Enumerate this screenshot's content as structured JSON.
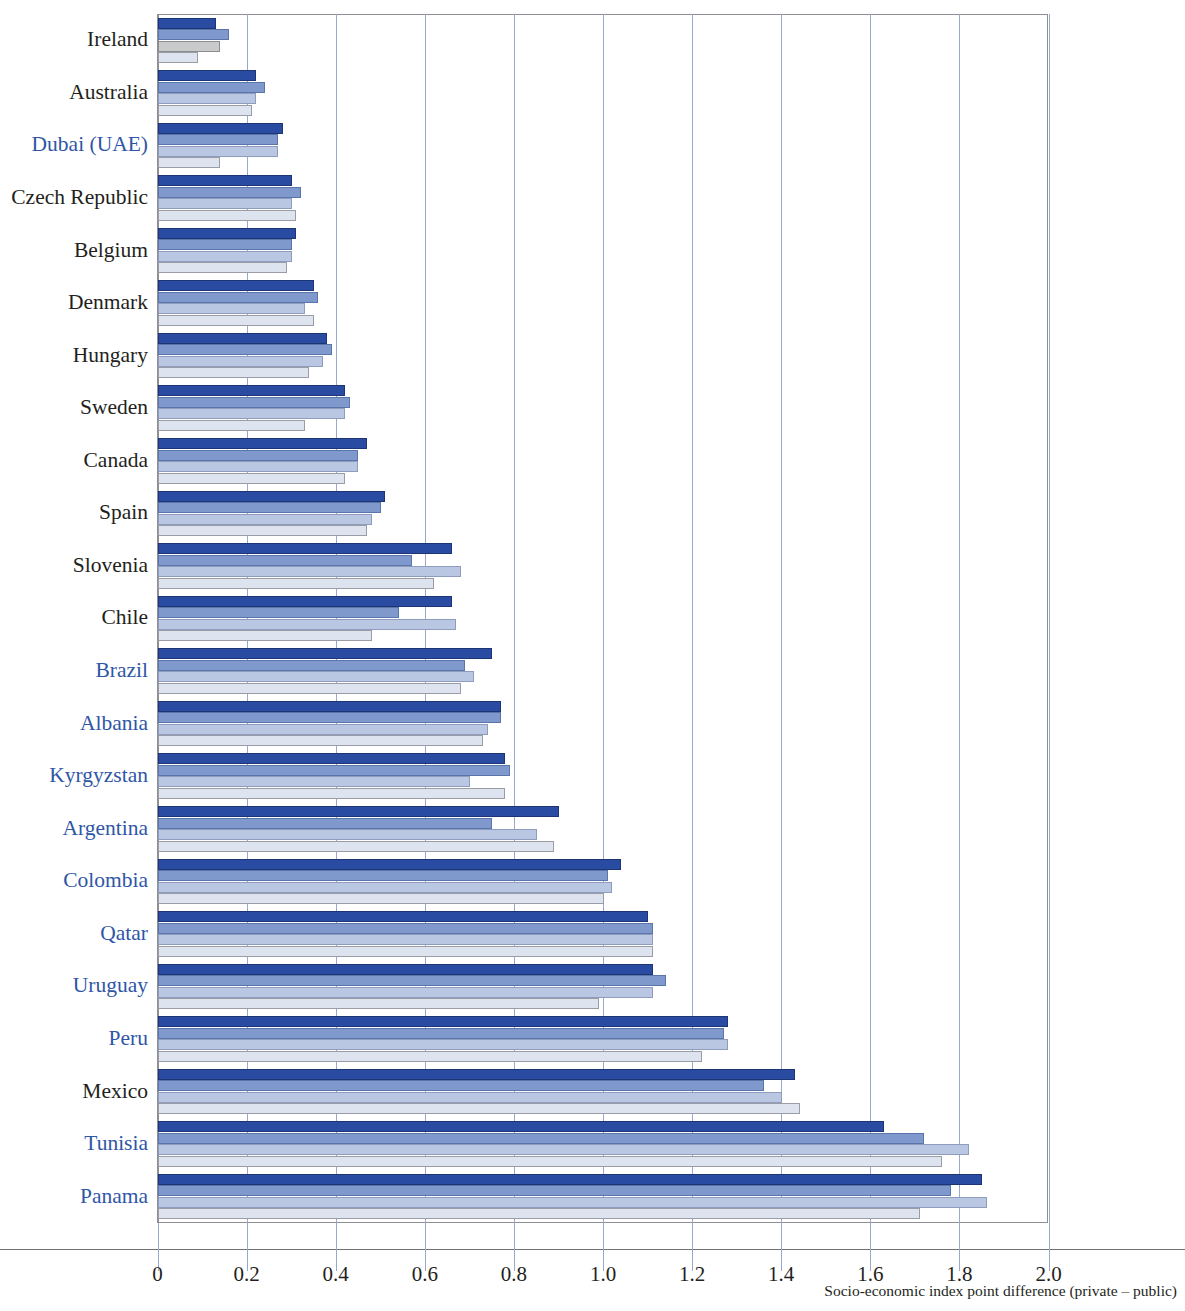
{
  "chart_data": {
    "type": "bar",
    "orientation": "horizontal",
    "title": "",
    "subtitle": "",
    "xlabel": "Socio-economic index point difference (private – public)",
    "ylabel": "",
    "xlim": [
      0,
      2.08
    ],
    "xticks": [
      0,
      0.2,
      0.4,
      0.6,
      0.8,
      1.0,
      1.2,
      1.4,
      1.6,
      1.8,
      2.0
    ],
    "xticklabels": [
      "0",
      "0.2",
      "0.4",
      "0.6",
      "0.8",
      "1.0",
      "1.2",
      "1.4",
      "1.6",
      "1.8",
      "2.0"
    ],
    "grid": "vertical",
    "legend": "none",
    "series": [
      {
        "name": "series-1",
        "color": "#2a4ba2"
      },
      {
        "name": "series-2",
        "color": "#7f99cd"
      },
      {
        "name": "series-3",
        "color": "#b9c7e2"
      },
      {
        "name": "series-4",
        "color": "#dde4f0"
      }
    ],
    "categories": [
      "Ireland",
      "Australia",
      "Dubai (UAE)",
      "Czech Republic",
      "Belgium",
      "Denmark",
      "Hungary",
      "Sweden",
      "Canada",
      "Spain",
      "Slovenia",
      "Chile",
      "Brazil",
      "Albania",
      "Kyrgyzstan",
      "Argentina",
      "Colombia",
      "Qatar",
      "Uruguay",
      "Peru",
      "Mexico",
      "Tunisia",
      "Panama"
    ],
    "rows": [
      {
        "label": "Ireland",
        "highlight": false,
        "values": [
          0.13,
          0.16,
          0.14,
          0.09
        ],
        "special": [
          null,
          null,
          "grey",
          null
        ]
      },
      {
        "label": "Australia",
        "highlight": false,
        "values": [
          0.22,
          0.24,
          0.22,
          0.21
        ],
        "special": [
          null,
          null,
          null,
          null
        ]
      },
      {
        "label": "Dubai (UAE)",
        "highlight": true,
        "values": [
          0.28,
          0.27,
          0.27,
          0.14
        ],
        "special": [
          null,
          null,
          null,
          null
        ]
      },
      {
        "label": "Czech Republic",
        "highlight": false,
        "values": [
          0.3,
          0.32,
          0.3,
          0.31
        ],
        "special": [
          null,
          null,
          null,
          null
        ]
      },
      {
        "label": "Belgium",
        "highlight": false,
        "values": [
          0.31,
          0.3,
          0.3,
          0.29
        ],
        "special": [
          null,
          null,
          null,
          null
        ]
      },
      {
        "label": "Denmark",
        "highlight": false,
        "values": [
          0.35,
          0.36,
          0.33,
          0.35
        ],
        "special": [
          null,
          null,
          null,
          null
        ]
      },
      {
        "label": "Hungary",
        "highlight": false,
        "values": [
          0.38,
          0.39,
          0.37,
          0.34
        ],
        "special": [
          null,
          null,
          null,
          null
        ]
      },
      {
        "label": "Sweden",
        "highlight": false,
        "values": [
          0.42,
          0.43,
          0.42,
          0.33
        ],
        "special": [
          null,
          null,
          null,
          null
        ]
      },
      {
        "label": "Canada",
        "highlight": false,
        "values": [
          0.47,
          0.45,
          0.45,
          0.42
        ],
        "special": [
          null,
          null,
          null,
          null
        ]
      },
      {
        "label": "Spain",
        "highlight": false,
        "values": [
          0.51,
          0.5,
          0.48,
          0.47
        ],
        "special": [
          null,
          null,
          null,
          null
        ]
      },
      {
        "label": "Slovenia",
        "highlight": false,
        "values": [
          0.66,
          0.57,
          0.68,
          0.62
        ],
        "special": [
          null,
          null,
          null,
          null
        ]
      },
      {
        "label": "Chile",
        "highlight": false,
        "values": [
          0.66,
          0.54,
          0.67,
          0.48
        ],
        "special": [
          null,
          null,
          null,
          null
        ]
      },
      {
        "label": "Brazil",
        "highlight": true,
        "values": [
          0.75,
          0.69,
          0.71,
          0.68
        ],
        "special": [
          null,
          null,
          null,
          null
        ]
      },
      {
        "label": "Albania",
        "highlight": true,
        "values": [
          0.77,
          0.77,
          0.74,
          0.73
        ],
        "special": [
          null,
          null,
          null,
          null
        ]
      },
      {
        "label": "Kyrgyzstan",
        "highlight": true,
        "values": [
          0.78,
          0.79,
          0.7,
          0.78
        ],
        "special": [
          null,
          null,
          null,
          null
        ]
      },
      {
        "label": "Argentina",
        "highlight": true,
        "values": [
          0.9,
          0.75,
          0.85,
          0.89
        ],
        "special": [
          null,
          null,
          null,
          null
        ]
      },
      {
        "label": "Colombia",
        "highlight": true,
        "values": [
          1.04,
          1.01,
          1.02,
          1.0
        ],
        "special": [
          null,
          null,
          null,
          null
        ]
      },
      {
        "label": "Qatar",
        "highlight": true,
        "values": [
          1.1,
          1.11,
          1.11,
          1.11
        ],
        "special": [
          null,
          null,
          null,
          null
        ]
      },
      {
        "label": "Uruguay",
        "highlight": true,
        "values": [
          1.11,
          1.14,
          1.11,
          0.99
        ],
        "special": [
          null,
          null,
          null,
          null
        ]
      },
      {
        "label": "Peru",
        "highlight": true,
        "values": [
          1.28,
          1.27,
          1.28,
          1.22
        ],
        "special": [
          null,
          null,
          null,
          null
        ]
      },
      {
        "label": "Mexico",
        "highlight": false,
        "values": [
          1.43,
          1.36,
          1.4,
          1.44
        ],
        "special": [
          null,
          null,
          null,
          null
        ]
      },
      {
        "label": "Tunisia",
        "highlight": true,
        "values": [
          1.63,
          1.72,
          1.82,
          1.76
        ],
        "special": [
          null,
          null,
          null,
          null
        ]
      },
      {
        "label": "Panama",
        "highlight": true,
        "values": [
          1.85,
          1.78,
          1.86,
          1.71
        ],
        "special": [
          null,
          null,
          null,
          null
        ]
      }
    ]
  },
  "axis": {
    "xlabel": "Socio-economic index point difference (private – public)",
    "ticklabels": [
      "0",
      "0.2",
      "0.4",
      "0.6",
      "0.8",
      "1.0",
      "1.2",
      "1.4",
      "1.6",
      "1.8",
      "2.0"
    ]
  },
  "colors": {
    "series_1": "#2a4ba2",
    "series_2": "#7f99cd",
    "series_3": "#b9c7e2",
    "series_4": "#dde4f0",
    "grey_bar": "#c9cacb",
    "highlight_label": "#2f56a6",
    "normal_label": "#231f20",
    "gridline": "#9aa7cf",
    "frame": "#8e8e93"
  }
}
